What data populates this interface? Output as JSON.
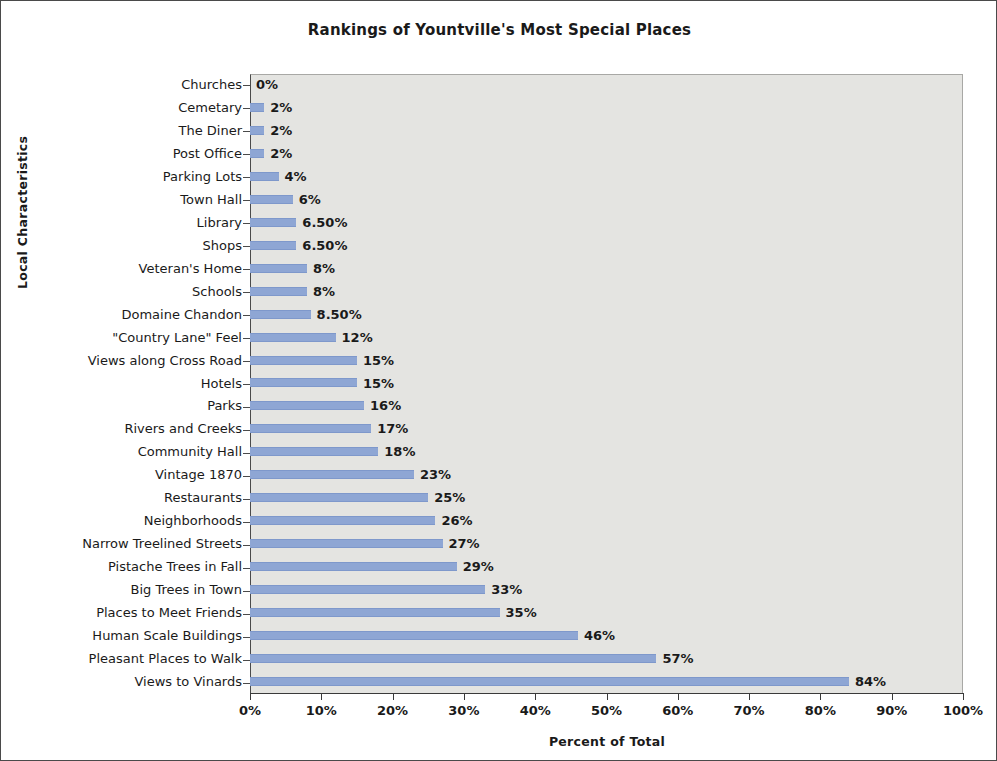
{
  "chart_data": {
    "type": "bar",
    "orientation": "horizontal",
    "title": "Rankings of Yountville's Most Special Places",
    "xlabel": "Percent of Total",
    "ylabel": "Local Characteristics",
    "xlim": [
      0,
      100
    ],
    "grid": false,
    "legend": null,
    "bar_color": "#8ea6d4",
    "plot_background": "#e4e4e1",
    "xtick_labels": [
      "0%",
      "10%",
      "20%",
      "30%",
      "40%",
      "50%",
      "60%",
      "70%",
      "80%",
      "90%",
      "100%"
    ],
    "xtick_values": [
      0,
      10,
      20,
      30,
      40,
      50,
      60,
      70,
      80,
      90,
      100
    ],
    "categories": [
      "Churches",
      "Cemetary",
      "The Diner",
      "Post Office",
      "Parking Lots",
      "Town Hall",
      "Library",
      "Shops",
      "Veteran's Home",
      "Schools",
      "Domaine Chandon",
      "\"Country Lane\" Feel",
      "Views along Cross Road",
      "Hotels",
      "Parks",
      "Rivers and Creeks",
      "Community Hall",
      "Vintage 1870",
      "Restaurants",
      "Neighborhoods",
      "Narrow Treelined Streets",
      "Pistache Trees in Fall",
      "Big Trees in Town",
      "Places to Meet Friends",
      "Human Scale Buildings",
      "Pleasant Places to Walk",
      "Views to Vinards"
    ],
    "values": [
      0,
      2,
      2,
      2,
      4,
      6,
      6.5,
      6.5,
      8,
      8,
      8.5,
      12,
      15,
      15,
      16,
      17,
      18,
      23,
      25,
      26,
      27,
      29,
      33,
      35,
      46,
      57,
      84
    ],
    "data_labels": [
      "0%",
      "2%",
      "2%",
      "2%",
      "4%",
      "6%",
      "6.50%",
      "6.50%",
      "8%",
      "8%",
      "8.50%",
      "12%",
      "15%",
      "15%",
      "16%",
      "17%",
      "18%",
      "23%",
      "25%",
      "26%",
      "27%",
      "29%",
      "33%",
      "35%",
      "46%",
      "57%",
      "84%"
    ]
  }
}
